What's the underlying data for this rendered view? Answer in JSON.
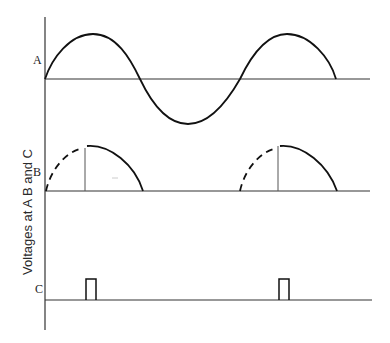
{
  "figure": {
    "y_axis_label": "Voltages at A B and C",
    "traces": [
      {
        "id": "A",
        "label": "A",
        "description": "full sine wave, two cycles start"
      },
      {
        "id": "B",
        "label": "B",
        "description": "half-wave pulses, partially dashed (phase-controlled conduction)"
      },
      {
        "id": "C",
        "label": "C",
        "description": "trigger pulses"
      }
    ],
    "colors": {
      "line": "#1a1a1a",
      "background": "#ffffff"
    }
  }
}
